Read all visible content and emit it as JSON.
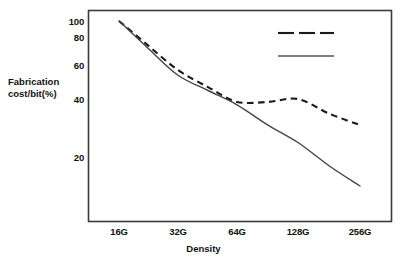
{
  "chart_data": {
    "type": "line",
    "title": "",
    "xlabel": "Density",
    "ylabel": "Fabrication cost/bit(%)",
    "ylabel_lines": [
      "Fabrication",
      "cost/bit(%)"
    ],
    "categories": [
      "16G",
      "32G",
      "64G",
      "128G",
      "256G"
    ],
    "x_tick_labels": [
      "16G",
      "32G",
      "64G",
      "128G",
      "256G"
    ],
    "y_tick_labels": [
      "100",
      "80",
      "60",
      "40",
      "20"
    ],
    "y_tick_values": [
      100,
      80,
      60,
      40,
      20
    ],
    "ylim": [
      0,
      105
    ],
    "grid": false,
    "legend_position": "top-right",
    "series": [
      {
        "name": "Planar",
        "style": "dashed",
        "color": "#1a1a1a",
        "values": [
          100,
          57,
          39,
          40,
          31
        ],
        "points": [
          {
            "x": "16G",
            "y": 100
          },
          {
            "x": "24G",
            "y": 74
          },
          {
            "x": "32G",
            "y": 57
          },
          {
            "x": "45G",
            "y": 47
          },
          {
            "x": "64G",
            "y": 39
          },
          {
            "x": "90G",
            "y": 39
          },
          {
            "x": "128G",
            "y": 40
          },
          {
            "x": "180G",
            "y": 35
          },
          {
            "x": "256G",
            "y": 31
          }
        ]
      },
      {
        "name": "2-tier",
        "style": "solid",
        "color": "#444444",
        "values": [
          100,
          54,
          38,
          25,
          10
        ],
        "points": [
          {
            "x": "16G",
            "y": 100
          },
          {
            "x": "24G",
            "y": 72
          },
          {
            "x": "32G",
            "y": 54
          },
          {
            "x": "45G",
            "y": 45
          },
          {
            "x": "64G",
            "y": 38
          },
          {
            "x": "90G",
            "y": 31
          },
          {
            "x": "128G",
            "y": 25
          },
          {
            "x": "180G",
            "y": 17
          },
          {
            "x": "256G",
            "y": 10
          }
        ]
      }
    ],
    "legend": [
      {
        "label": "Planar",
        "style": "dashed"
      },
      {
        "label": "2-tier",
        "style": "solid"
      }
    ],
    "colors": {
      "axis": "#3b3b3b",
      "planar": "#1a1a1a",
      "two_tier": "#555555",
      "background": "#ffffff",
      "text": "#111111"
    }
  }
}
